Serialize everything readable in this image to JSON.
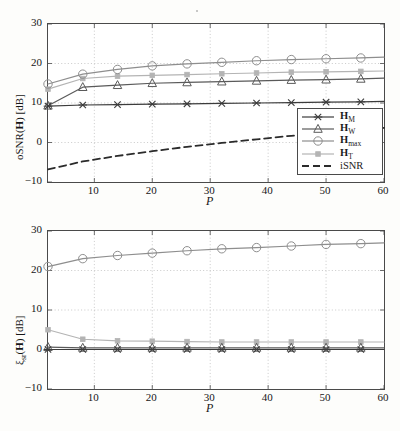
{
  "figure": {
    "panels": [
      {
        "id": "top",
        "ylabel_plain": "oSNR(H) [dB]",
        "xlabel": "P"
      },
      {
        "id": "bottom",
        "ylabel_plain": "ξ_sr(H) [dB]",
        "xlabel": "P"
      }
    ]
  },
  "legend": {
    "position": "bottom-right-of-top-panel",
    "entries": [
      {
        "label_main": "H",
        "label_sub": "M",
        "marker": "x-marker",
        "style": "solid",
        "color": "#3c3c3c"
      },
      {
        "label_main": "H",
        "label_sub": "W",
        "marker": "triangle-marker",
        "style": "solid",
        "color": "#5a5a5a"
      },
      {
        "label_main": "H",
        "label_sub": "max",
        "marker": "circle-marker",
        "style": "solid",
        "color": "#8e8e8e"
      },
      {
        "label_main": "H",
        "label_sub": "T",
        "marker": "square-marker",
        "style": "solid",
        "color": "#b4b4b4"
      },
      {
        "label_main": "iSNR",
        "label_sub": "",
        "marker": "none",
        "style": "dashed",
        "color": "#2b2b2b"
      }
    ]
  },
  "chart_data": [
    {
      "type": "line",
      "id": "oSNR-vs-P",
      "title": "",
      "xlabel": "P",
      "ylabel": "oSNR(H) [dB]",
      "xlim": [
        2,
        60
      ],
      "ylim": [
        -10,
        30
      ],
      "xticks": [
        10,
        20,
        30,
        40,
        50,
        60
      ],
      "yticks": [
        -10,
        0,
        10,
        20,
        30
      ],
      "grid": true,
      "marker_x": [
        2,
        8,
        14,
        20,
        26,
        32,
        38,
        44,
        50,
        56
      ],
      "series": [
        {
          "name": "H_M",
          "marker": "x-marker",
          "color": "#3c3c3c",
          "style": "solid",
          "x": [
            2,
            8,
            14,
            20,
            26,
            32,
            38,
            44,
            50,
            56,
            60
          ],
          "values": [
            9.2,
            9.5,
            9.6,
            9.7,
            9.8,
            9.9,
            10.0,
            10.1,
            10.2,
            10.3,
            10.4
          ]
        },
        {
          "name": "H_W",
          "marker": "triangle-marker",
          "color": "#5a5a5a",
          "style": "solid",
          "x": [
            2,
            8,
            14,
            20,
            26,
            32,
            38,
            44,
            50,
            56,
            60
          ],
          "values": [
            9.3,
            14.0,
            14.5,
            15.0,
            15.2,
            15.4,
            15.6,
            15.8,
            15.9,
            16.1,
            16.3
          ]
        },
        {
          "name": "H_max",
          "marker": "circle-marker",
          "color": "#8e8e8e",
          "style": "solid",
          "x": [
            2,
            8,
            14,
            20,
            26,
            32,
            38,
            44,
            50,
            56,
            60
          ],
          "values": [
            14.8,
            17.3,
            18.5,
            19.4,
            19.9,
            20.3,
            20.7,
            21.0,
            21.2,
            21.4,
            21.6
          ]
        },
        {
          "name": "H_T",
          "marker": "square-marker",
          "color": "#b4b4b4",
          "style": "solid",
          "x": [
            2,
            8,
            14,
            20,
            26,
            32,
            38,
            44,
            50,
            56,
            60
          ],
          "values": [
            13.5,
            16.2,
            16.8,
            17.0,
            17.2,
            17.4,
            17.6,
            17.8,
            17.9,
            18.0,
            18.1
          ]
        },
        {
          "name": "iSNR",
          "marker": "none",
          "color": "#2b2b2b",
          "style": "dashed",
          "x": [
            2,
            8,
            14,
            20,
            26,
            32,
            38,
            44,
            50,
            56,
            60
          ],
          "values": [
            -6.8,
            -4.8,
            -3.4,
            -2.2,
            -1.1,
            -0.1,
            0.8,
            1.7,
            2.5,
            3.2,
            3.7
          ]
        }
      ]
    },
    {
      "type": "line",
      "id": "speech-reduction-vs-P",
      "title": "",
      "xlabel": "P",
      "ylabel": "ξ_sr(H) [dB]",
      "xlim": [
        2,
        60
      ],
      "ylim": [
        -10,
        30
      ],
      "xticks": [
        10,
        20,
        30,
        40,
        50,
        60
      ],
      "yticks": [
        -10,
        0,
        10,
        20,
        30
      ],
      "grid": true,
      "marker_x": [
        2,
        8,
        14,
        20,
        26,
        32,
        38,
        44,
        50,
        56
      ],
      "series": [
        {
          "name": "H_M",
          "marker": "x-marker",
          "color": "#3c3c3c",
          "style": "solid",
          "x": [
            2,
            8,
            14,
            20,
            26,
            32,
            38,
            44,
            50,
            56,
            60
          ],
          "values": [
            0.0,
            0.0,
            0.0,
            0.0,
            0.0,
            0.0,
            0.0,
            0.0,
            0.0,
            0.0,
            0.0
          ]
        },
        {
          "name": "H_W",
          "marker": "triangle-marker",
          "color": "#5a5a5a",
          "style": "solid",
          "x": [
            2,
            8,
            14,
            20,
            26,
            32,
            38,
            44,
            50,
            56,
            60
          ],
          "values": [
            0.6,
            0.4,
            0.4,
            0.4,
            0.4,
            0.4,
            0.4,
            0.4,
            0.4,
            0.4,
            0.4
          ]
        },
        {
          "name": "H_max",
          "marker": "circle-marker",
          "color": "#8e8e8e",
          "style": "solid",
          "x": [
            2,
            8,
            14,
            20,
            26,
            32,
            38,
            44,
            50,
            56,
            60
          ],
          "values": [
            21.0,
            23.0,
            23.8,
            24.4,
            25.0,
            25.5,
            25.8,
            26.2,
            26.6,
            26.8,
            27.0
          ]
        },
        {
          "name": "H_T",
          "marker": "square-marker",
          "color": "#b4b4b4",
          "style": "solid",
          "x": [
            2,
            8,
            14,
            20,
            26,
            32,
            38,
            44,
            50,
            56,
            60
          ],
          "values": [
            5.0,
            2.6,
            2.2,
            2.1,
            2.0,
            1.9,
            1.9,
            1.9,
            1.9,
            1.9,
            1.9
          ]
        }
      ]
    }
  ]
}
